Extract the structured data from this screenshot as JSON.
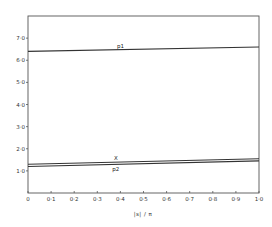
{
  "chart_data": {
    "type": "line",
    "title": "",
    "xlabel": "|s| / π",
    "ylabel": "",
    "xlim": [
      0,
      1.0
    ],
    "ylim": [
      0,
      8.0
    ],
    "grid": false,
    "x_ticks": [
      "0",
      "0·1",
      "0·2",
      "0·3",
      "0·4",
      "0·5",
      "0·6",
      "0·7",
      "0·8",
      "0·9",
      "1·0"
    ],
    "y_ticks": [
      "1·0",
      "2·0",
      "3·0",
      "4·0",
      "5·0",
      "6·0",
      "7·0"
    ],
    "x": [
      0,
      1.0
    ],
    "series": [
      {
        "name": "p1",
        "values": [
          6.4,
          6.6
        ],
        "label_x": 0.4
      },
      {
        "name": "X",
        "values": [
          1.3,
          1.55
        ],
        "label_x": 0.38
      },
      {
        "name": "p2",
        "values": [
          1.2,
          1.45
        ],
        "label_x": 0.38
      }
    ]
  }
}
